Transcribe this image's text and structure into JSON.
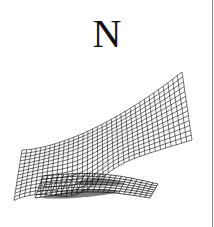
{
  "figure": {
    "panel_label": "N",
    "content": "3D wireframe surface plot",
    "colors": {
      "background": "#ffffff",
      "ink": "#111111",
      "border": "#8a8a8a"
    }
  }
}
